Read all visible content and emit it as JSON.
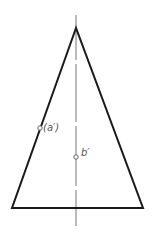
{
  "diagram": {
    "type": "cone-front-view-projection",
    "colors": {
      "outline": "#1a1a1a",
      "axis": "#777777",
      "point": "#666666",
      "label": "#555555",
      "background": "#ffffff"
    },
    "apex": {
      "x": 76,
      "y": 28
    },
    "base": {
      "left": {
        "x": 12,
        "y": 208
      },
      "right": {
        "x": 143,
        "y": 208
      }
    },
    "axis": {
      "x": 76,
      "y_top": 15,
      "y_bottom": 226
    },
    "points": [
      {
        "id": "a",
        "label": "(a′)",
        "x": 40,
        "y": 128,
        "label_x": 44,
        "label_y": 128
      },
      {
        "id": "b",
        "label": "b′",
        "x": 76,
        "y": 157,
        "label_x": 81,
        "label_y": 155
      }
    ]
  }
}
